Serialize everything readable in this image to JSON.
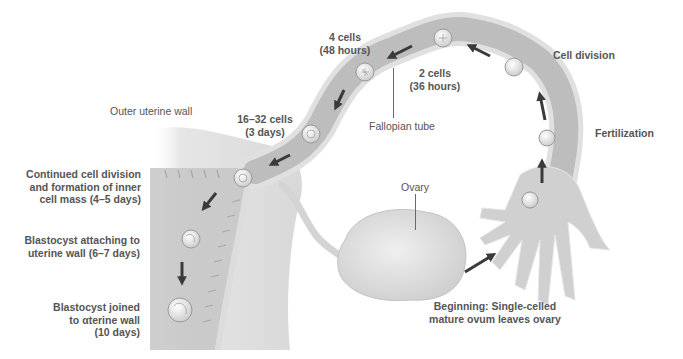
{
  "diagram": {
    "colors": {
      "background": "#ffffff",
      "tube_fill": "#bdbdbd",
      "tube_edge": "#e2e2e2",
      "uterus_fill": "#dcdcdc",
      "ovary_fill": "#e4e4e4",
      "arrow": "#3a3a3a",
      "label_text": "#555555",
      "leader_line": "#6a6a6a"
    },
    "labels": {
      "four_cells": [
        "4 cells",
        "(48 hours)"
      ],
      "two_cells": [
        "2 cells",
        "(36 hours)"
      ],
      "cell_division": "Cell division",
      "fertilization": "Fertilization",
      "fallopian_tube": "Fallopian tube",
      "outer_uterine_wall": "Outer uterine wall",
      "sixteen_cells": [
        "16–32 cells",
        "(3 days)"
      ],
      "continued_division": [
        "Continued cell division",
        "and formation of inner",
        "cell mass (4–5 days)"
      ],
      "blastocyst_attaching": [
        "Blastocyst attaching to",
        "uterine wall (6–7 days)"
      ],
      "blastocyst_joined": [
        "Blastocyst joined",
        "to αterine wall",
        "(10 days)"
      ],
      "ovary": "Ovary",
      "beginning": [
        "Beginning: Single-celled",
        "mature ovum leaves ovary"
      ]
    },
    "stages": [
      {
        "name": "ovum-released",
        "x": 465,
        "y": 268
      },
      {
        "name": "ovum-in-fimbriae",
        "x": 530,
        "y": 200
      },
      {
        "name": "fertilization",
        "x": 547,
        "y": 138
      },
      {
        "name": "cell-division",
        "x": 514,
        "y": 67
      },
      {
        "name": "two-cells",
        "x": 443,
        "y": 38
      },
      {
        "name": "four-cells",
        "x": 365,
        "y": 72
      },
      {
        "name": "sixteen-32-cells",
        "x": 311,
        "y": 134
      },
      {
        "name": "inner-cell-mass",
        "x": 243,
        "y": 178
      },
      {
        "name": "blastocyst-attaching",
        "x": 191,
        "y": 239
      },
      {
        "name": "blastocyst-joined",
        "x": 180,
        "y": 310
      }
    ]
  }
}
